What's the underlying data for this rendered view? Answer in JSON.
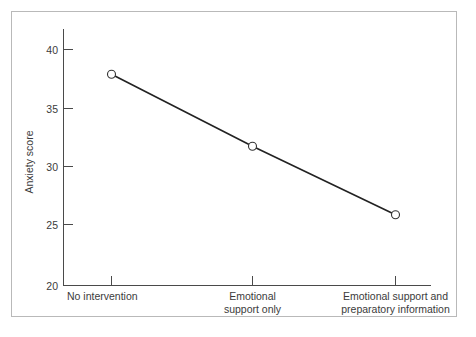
{
  "chart_data": {
    "type": "line",
    "title": "",
    "xlabel": "",
    "ylabel": "Anxiety score",
    "categories": [
      "No intervention",
      "Emotional support only",
      "Emotional support and preparatory information"
    ],
    "category_lines": [
      [
        "No intervention"
      ],
      [
        "Emotional",
        "support only"
      ],
      [
        "Emotional support and",
        "preparatory information"
      ]
    ],
    "values": [
      37.9,
      31.8,
      26.0
    ],
    "ylim": [
      20,
      41
    ],
    "yticks": [
      20,
      25,
      30,
      35,
      40
    ],
    "ytick_labels": [
      "20",
      "25",
      "30",
      "35",
      "40"
    ],
    "grid": false,
    "legend": false,
    "marker": "open-circle",
    "line_color": "#222222",
    "marker_fill": "#ffffff",
    "marker_edge_color": "#333333",
    "axis_color": "#4a4a4a",
    "frame_border_color": "#b9b9b9",
    "background_color": "#ffffff"
  }
}
